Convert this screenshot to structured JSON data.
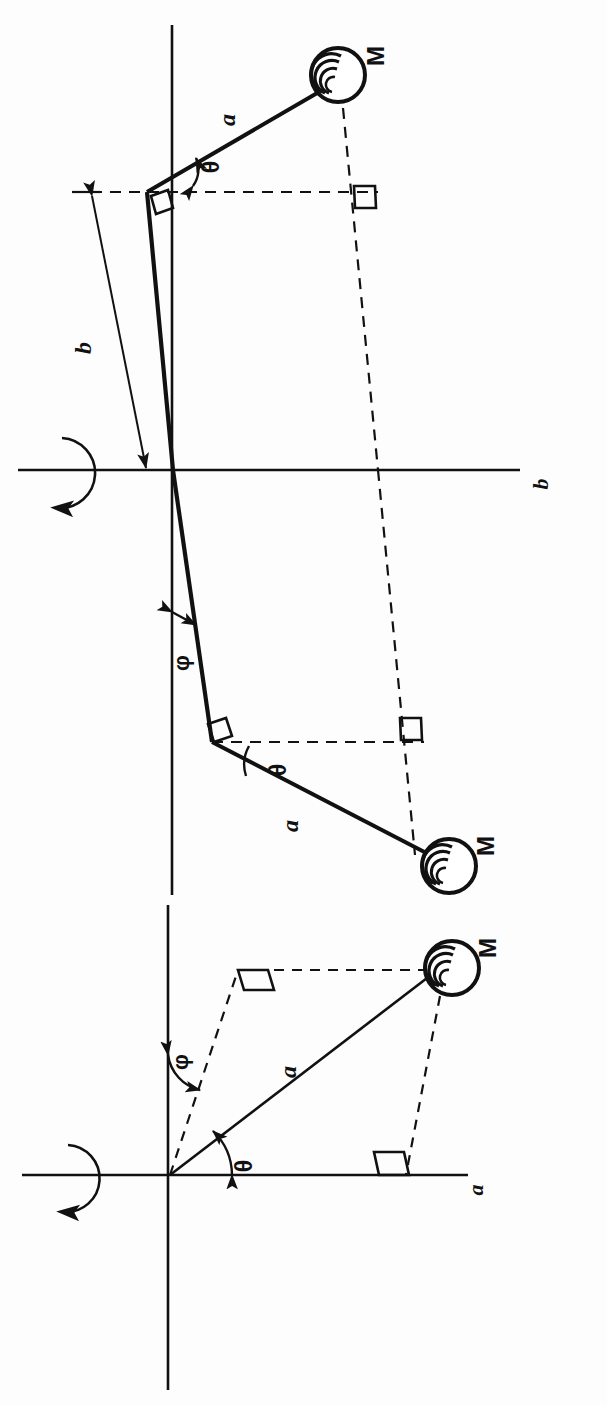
{
  "figure": {
    "orientation_note": "page rotated 90 degrees; all labels printed sideways",
    "stroke_color": "#111111",
    "background_color": "#fdfdfd",
    "line_style_solid": "solid",
    "line_style_dashed": "dashed"
  },
  "panels": [
    {
      "id": "panel-top",
      "name": "bent-shaft-view",
      "axis_label": "b",
      "rotation_symbol": "curved-rotation-arrow",
      "labels": {
        "mass_upper": "M",
        "mass_lower": "M",
        "arm_upper": "a",
        "arm_lower": "a",
        "offset": "b",
        "angle_theta_upper": "θ",
        "angle_theta_lower": "θ",
        "angle_phi": "φ"
      },
      "right_angle_markers": 4
    },
    {
      "id": "panel-bottom",
      "name": "straight-shaft-view",
      "axis_label": "a",
      "rotation_symbol": "curved-rotation-arrow",
      "labels": {
        "mass": "M",
        "arm": "a",
        "angle_theta": "θ",
        "angle_phi": "φ"
      },
      "right_angle_markers": 2
    }
  ],
  "glyphs": {
    "mass_symbol": "hatched-circle",
    "theta": "θ",
    "phi": "φ",
    "mass": "M",
    "a": "a",
    "b": "b"
  }
}
